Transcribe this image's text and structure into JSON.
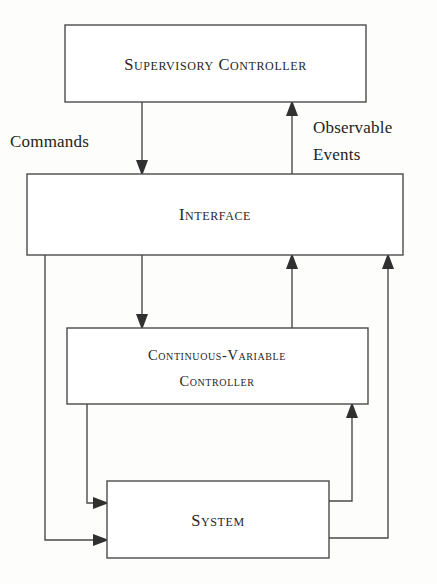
{
  "figure": {
    "type": "block-diagram",
    "background_color": "#fdfdfc",
    "line_color": "#4a4a4a",
    "text_color": "#262626"
  },
  "boxes": {
    "supervisory_controller": {
      "label": "Supervisory Controller",
      "x": 65,
      "y": 25,
      "width": 301,
      "height": 77
    },
    "interface": {
      "label": "Interface",
      "x": 27,
      "y": 174,
      "width": 376,
      "height": 81
    },
    "cv_controller": {
      "label_line1": "Continuous-Variable",
      "label_line2": "Controller",
      "x": 67,
      "y": 328,
      "width": 301,
      "height": 76
    },
    "system": {
      "label": "System",
      "x": 107,
      "y": 481,
      "width": 222,
      "height": 77
    }
  },
  "edge_labels": {
    "commands": {
      "text": "Commands",
      "x": 10,
      "y": 147
    },
    "observable_events_line1": {
      "text": "Observable",
      "x": 313,
      "y": 133
    },
    "observable_events_line2": {
      "text": "Events",
      "x": 313,
      "y": 160
    }
  },
  "connections": [
    {
      "name": "commands-down",
      "from": "supervisory_controller",
      "to": "interface",
      "direction": "down",
      "path": "M142,102 L142,169",
      "arrow": {
        "x": 142,
        "y": 174,
        "dir": "down"
      }
    },
    {
      "name": "observable-events-up",
      "from": "interface",
      "to": "supervisory_controller",
      "direction": "up",
      "path": "M292,174 L292,107",
      "arrow": {
        "x": 292,
        "y": 102,
        "dir": "up"
      }
    },
    {
      "name": "interface-to-cv-controller",
      "from": "interface",
      "to": "cv_controller",
      "direction": "down",
      "path": "M142,255 L142,323",
      "arrow": {
        "x": 142,
        "y": 328,
        "dir": "down"
      }
    },
    {
      "name": "cv-controller-to-interface",
      "from": "cv_controller",
      "to": "interface",
      "direction": "up",
      "path": "M292,328 L292,260",
      "arrow": {
        "x": 292,
        "y": 255,
        "dir": "up"
      }
    },
    {
      "name": "interface-to-system-left",
      "from": "interface",
      "to": "system",
      "direction": "down-right",
      "path": "M45,255 L45,540 L102,540",
      "arrow": {
        "x": 107,
        "y": 540,
        "dir": "right"
      }
    },
    {
      "name": "cv-controller-to-system",
      "from": "cv_controller",
      "to": "system",
      "direction": "down-right",
      "path": "M87,404 L87,503 L102,503",
      "arrow": {
        "x": 107,
        "y": 503,
        "dir": "right"
      }
    },
    {
      "name": "system-to-cv-controller",
      "from": "system",
      "to": "cv_controller",
      "direction": "right-up",
      "path": "M329,501 L352,501 L352,409",
      "arrow": {
        "x": 352,
        "y": 404,
        "dir": "up"
      }
    },
    {
      "name": "system-to-interface",
      "from": "system",
      "to": "interface",
      "direction": "right-up",
      "path": "M329,538 L388,538 L388,260",
      "arrow": {
        "x": 388,
        "y": 255,
        "dir": "up"
      }
    }
  ]
}
